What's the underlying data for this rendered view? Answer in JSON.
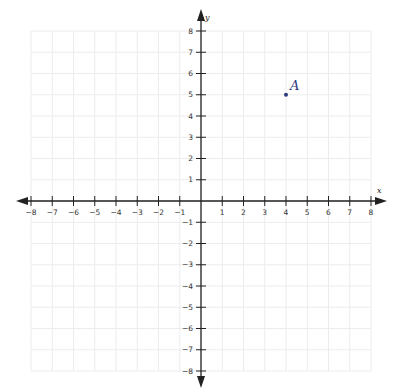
{
  "chart_data": {
    "type": "scatter",
    "title": "",
    "xlabel": "x",
    "ylabel": "y",
    "xlim": [
      -8,
      8
    ],
    "ylim": [
      -8,
      8
    ],
    "grid": true,
    "x_ticks": [
      -8,
      -7,
      -6,
      -5,
      -4,
      -3,
      -2,
      -1,
      1,
      2,
      3,
      4,
      5,
      6,
      7,
      8
    ],
    "y_ticks": [
      -8,
      -7,
      -6,
      -5,
      -4,
      -3,
      -2,
      -1,
      1,
      2,
      3,
      4,
      5,
      6,
      7,
      8
    ],
    "points": [
      {
        "label": "A",
        "x": 4,
        "y": 5
      }
    ]
  },
  "colors": {
    "axis": "#222222",
    "grid": "#ececec",
    "point": "#2d3a7a"
  }
}
